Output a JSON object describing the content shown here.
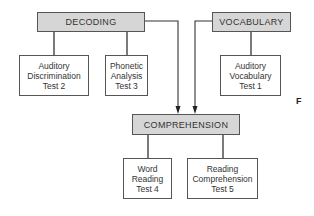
{
  "diagram": {
    "categories": {
      "decoding": "DECODING",
      "vocabulary": "VOCABULARY",
      "comprehension": "COMPREHENSION"
    },
    "tests": {
      "auditory_discrimination": {
        "line1": "Auditory",
        "line2": "Discrimination",
        "line3": "Test 2"
      },
      "phonetic_analysis": {
        "line1": "Phonetic",
        "line2": "Analysis",
        "line3": "Test 3"
      },
      "auditory_vocabulary": {
        "line1": "Auditory",
        "line2": "Vocabulary",
        "line3": "Test 1"
      },
      "word_reading": {
        "line1": "Word",
        "line2": "Reading",
        "line3": "Test 4"
      },
      "reading_comprehension": {
        "line1": "Reading",
        "line2": "Comprehension",
        "line3": "Test 5"
      }
    },
    "edges": [
      {
        "from": "DECODING",
        "to": "Auditory Discrimination Test 2",
        "type": "line"
      },
      {
        "from": "DECODING",
        "to": "Phonetic Analysis Test 3",
        "type": "line"
      },
      {
        "from": "VOCABULARY",
        "to": "Auditory Vocabulary Test 1",
        "type": "line"
      },
      {
        "from": "DECODING",
        "to": "COMPREHENSION",
        "type": "arrow"
      },
      {
        "from": "VOCABULARY",
        "to": "COMPREHENSION",
        "type": "arrow"
      },
      {
        "from": "COMPREHENSION",
        "to": "Word Reading Test 4",
        "type": "line"
      },
      {
        "from": "COMPREHENSION",
        "to": "Reading Comprehension Test 5",
        "type": "line"
      }
    ],
    "side_label": "F",
    "colors": {
      "category_fill": "#d6d6d6",
      "border": "#555555",
      "text": "#333333"
    }
  }
}
